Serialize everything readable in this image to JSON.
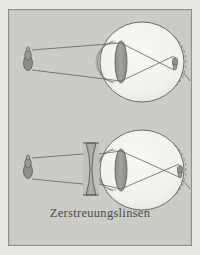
{
  "figure": {
    "caption": "Zerstreuungslinsen",
    "background_color": "#cdcdc8",
    "page_color": "#e9e9e6",
    "ink_color": "#4a4a47",
    "frame_color": "#8f8f8b",
    "lens_fill": "#9a9a96",
    "eye_fill": "#f2f2ee",
    "panels": [
      {
        "id": "panel-uncorrected",
        "label": "uncorrected-myopic-eye",
        "object_label": "candle-object",
        "has_correcting_lens": false,
        "image_label": "inverted-retinal-image",
        "ray_count": 2
      },
      {
        "id": "panel-corrected",
        "label": "myopic-eye-with-diverging-lens",
        "object_label": "candle-object",
        "has_correcting_lens": true,
        "correcting_lens_label": "biconcave-diverging-lens",
        "image_label": "inverted-retinal-image",
        "ray_count": 2
      }
    ],
    "parts": {
      "object": "candle-object",
      "eyeball": "eyeball-outline",
      "cornea": "cornea-arc",
      "crystalline_lens": "crystalline-lens",
      "retina": "retina-arc",
      "optic_nerve": "optic-nerve",
      "ray": "light-ray",
      "diverging_lens": "diverging-lens"
    }
  }
}
